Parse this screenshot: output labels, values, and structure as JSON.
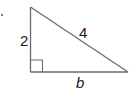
{
  "diagram": {
    "type": "right-triangle",
    "item_marker": ".",
    "sides": {
      "vertical_leg": "2",
      "hypotenuse": "4",
      "horizontal_leg": "b"
    },
    "right_angle_marker": true,
    "colors": {
      "line": "#6b6b6b",
      "text": "#1a1a1a"
    }
  }
}
